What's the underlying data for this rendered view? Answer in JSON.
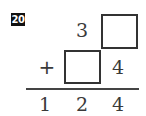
{
  "problem": {
    "number": "20",
    "rows": [
      {
        "operator": "",
        "cells": [
          "",
          "3",
          "[box]"
        ]
      },
      {
        "operator": "+",
        "cells": [
          "",
          "[box]",
          "4"
        ]
      }
    ],
    "result": [
      "1",
      "2",
      "4"
    ]
  },
  "labels": {
    "problem_number": "20",
    "row1_tens": "3",
    "row2_operator": "+",
    "row2_ones": "4",
    "result_hundreds": "1",
    "result_tens": "2",
    "result_ones": "4"
  },
  "colors": {
    "badge_bg": "#111111",
    "badge_text": "#ffffff",
    "ink": "#333333"
  }
}
